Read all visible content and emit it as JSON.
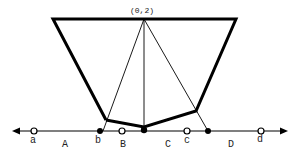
{
  "diagram": {
    "apex_label": "(0,2)",
    "point_labels": {
      "a": "a",
      "b": "b",
      "c": "c",
      "d": "d"
    },
    "region_labels": {
      "A": "A",
      "B": "B",
      "C": "C",
      "D": "D"
    },
    "colors": {
      "stroke": "#000000",
      "background": "#ffffff"
    }
  }
}
